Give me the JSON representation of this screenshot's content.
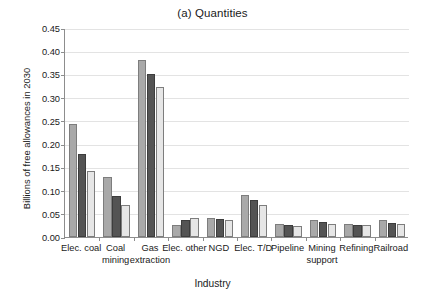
{
  "chart_data": {
    "type": "bar",
    "title": "(a) Quantities",
    "xlabel": "Industry",
    "ylabel": "Billions of free allowances in 2030",
    "ylim": [
      0,
      0.45
    ],
    "ytick_labels": [
      "0.00",
      "0.05",
      "0.10",
      "0.15",
      "0.20",
      "0.25",
      "0.30",
      "0.35",
      "0.40",
      "0.45"
    ],
    "ytick_values": [
      0,
      0.05,
      0.1,
      0.15,
      0.2,
      0.25,
      0.3,
      0.35,
      0.4,
      0.45
    ],
    "grid": true,
    "legend": "none",
    "categories": [
      "Elec. coal",
      "Coal mining",
      "Gas extraction",
      "Elec. other",
      "NGD",
      "Elec. T/D",
      "Pipeline",
      "Mining support",
      "Refining",
      "Railroad"
    ],
    "category_lines": [
      [
        "Elec. coal",
        ""
      ],
      [
        "Coal",
        "mining"
      ],
      [
        "Gas",
        "extraction"
      ],
      [
        "Elec. other",
        ""
      ],
      [
        "NGD",
        ""
      ],
      [
        "Elec. T/D",
        ""
      ],
      [
        "Pipeline",
        ""
      ],
      [
        "Mining",
        "support"
      ],
      [
        "Refining",
        ""
      ],
      [
        "Railroad",
        ""
      ]
    ],
    "series": [
      {
        "name": "Series 1",
        "color": "#a9a9a9",
        "values": [
          0.244,
          0.129,
          0.381,
          0.026,
          0.04,
          0.091,
          0.027,
          0.036,
          0.027,
          0.037
        ]
      },
      {
        "name": "Series 2",
        "color": "#545454",
        "values": [
          0.179,
          0.089,
          0.352,
          0.037,
          0.039,
          0.079,
          0.026,
          0.033,
          0.026,
          0.031
        ]
      },
      {
        "name": "Series 3",
        "color": "#e6e6e6",
        "values": [
          0.143,
          0.07,
          0.322,
          0.04,
          0.036,
          0.07,
          0.023,
          0.029,
          0.025,
          0.027
        ]
      }
    ]
  }
}
